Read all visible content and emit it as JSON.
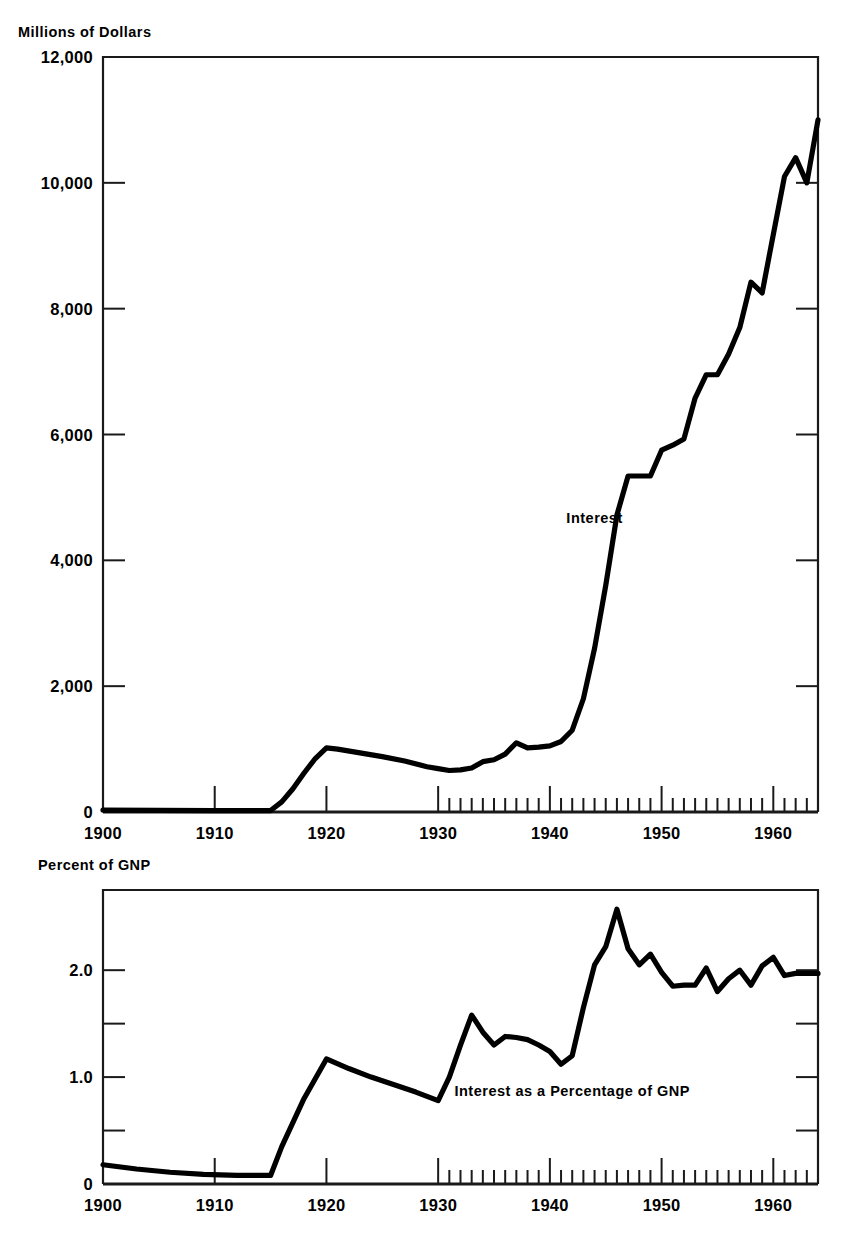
{
  "figure": {
    "cut_off_header": "",
    "top_axis_caption": "Millions of Dollars",
    "bottom_axis_caption": "Percent of GNP"
  },
  "chart_data": [
    {
      "id": "interest-dollars",
      "type": "line",
      "title": "",
      "xlabel": "",
      "ylabel": "Millions of Dollars",
      "xlim": [
        1900,
        1964
      ],
      "ylim": [
        0,
        12000
      ],
      "grid": false,
      "legend_position": "inline-annotation",
      "x_ticks_major": [
        1900,
        1910,
        1920,
        1930,
        1940,
        1950,
        1960
      ],
      "x_tick_labels": [
        "1900",
        "1910",
        "1920",
        "1930",
        "1940",
        "1950",
        "1960"
      ],
      "x_minor_tick_start": 1930,
      "x_minor_tick_end": 1964,
      "y_ticks": [
        0,
        2000,
        4000,
        6000,
        8000,
        10000,
        12000
      ],
      "y_tick_labels": [
        "0",
        "2,000",
        "4,000",
        "6,000",
        "8,000",
        "10,000",
        "12,000"
      ],
      "annotations": [
        {
          "text": "Interest",
          "x": 1944,
          "y": 4600
        }
      ],
      "series": [
        {
          "name": "Interest",
          "color": "#000000",
          "x": [
            1900,
            1905,
            1910,
            1913,
            1915,
            1916,
            1917,
            1918,
            1919,
            1920,
            1921,
            1923,
            1925,
            1927,
            1929,
            1930,
            1931,
            1932,
            1933,
            1934,
            1935,
            1936,
            1937,
            1938,
            1939,
            1940,
            1941,
            1942,
            1943,
            1944,
            1945,
            1946,
            1947,
            1948,
            1949,
            1950,
            1951,
            1952,
            1953,
            1954,
            1955,
            1956,
            1957,
            1958,
            1959,
            1960,
            1961,
            1962,
            1963,
            1964
          ],
          "values": [
            30,
            25,
            21,
            23,
            23,
            160,
            370,
            620,
            850,
            1020,
            1000,
            940,
            880,
            810,
            720,
            690,
            660,
            670,
            700,
            800,
            830,
            920,
            1100,
            1020,
            1030,
            1050,
            1120,
            1300,
            1800,
            2600,
            3600,
            4720,
            5340,
            5340,
            5340,
            5750,
            5830,
            5930,
            6580,
            6950,
            6950,
            7280,
            7700,
            8420,
            8250,
            9180,
            10100,
            10400,
            10000,
            11000,
            11800
          ]
        }
      ]
    },
    {
      "id": "interest-percent-gnp",
      "type": "line",
      "title": "",
      "xlabel": "",
      "ylabel": "Percent of GNP",
      "xlim": [
        1900,
        1964
      ],
      "ylim": [
        0,
        2.75
      ],
      "grid": false,
      "legend_position": "inline-annotation",
      "x_ticks_major": [
        1900,
        1910,
        1920,
        1930,
        1940,
        1950,
        1960
      ],
      "x_tick_labels": [
        "1900",
        "1910",
        "1920",
        "1930",
        "1940",
        "1950",
        "1960"
      ],
      "x_minor_tick_start": 1930,
      "x_minor_tick_end": 1964,
      "y_ticks": [
        0,
        0.5,
        1.0,
        1.5,
        2.0
      ],
      "y_tick_labels": [
        "0",
        "",
        "1.0",
        "",
        "2.0"
      ],
      "annotations": [
        {
          "text": "Interest as a Percentage of GNP",
          "x": 1942,
          "y": 0.82
        }
      ],
      "series": [
        {
          "name": "Interest as a Percentage of GNP",
          "color": "#000000",
          "x": [
            1900,
            1903,
            1906,
            1909,
            1912,
            1915,
            1916,
            1918,
            1920,
            1922,
            1924,
            1926,
            1928,
            1930,
            1931,
            1932,
            1933,
            1934,
            1935,
            1936,
            1937,
            1938,
            1939,
            1940,
            1941,
            1942,
            1943,
            1944,
            1945,
            1946,
            1947,
            1948,
            1949,
            1950,
            1951,
            1952,
            1953,
            1954,
            1955,
            1956,
            1957,
            1958,
            1959,
            1960,
            1961,
            1962,
            1963,
            1964
          ],
          "values": [
            0.18,
            0.14,
            0.11,
            0.09,
            0.08,
            0.08,
            0.35,
            0.8,
            1.17,
            1.08,
            1.0,
            0.93,
            0.86,
            0.78,
            1.0,
            1.3,
            1.58,
            1.42,
            1.3,
            1.38,
            1.37,
            1.35,
            1.3,
            1.24,
            1.12,
            1.2,
            1.65,
            2.05,
            2.22,
            2.57,
            2.2,
            2.05,
            2.15,
            1.98,
            1.85,
            1.86,
            1.86,
            2.02,
            1.8,
            1.92,
            2.0,
            1.86,
            2.04,
            2.12,
            1.95,
            1.97,
            1.97,
            1.97
          ]
        }
      ]
    }
  ]
}
